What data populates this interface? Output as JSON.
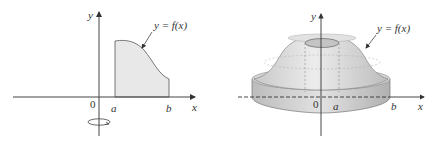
{
  "left_figure": {
    "y_axis_label": "y",
    "x_axis_label": "x",
    "origin_label": "0",
    "a_label": "a",
    "b_label": "b",
    "curve_label": "y = f(x)",
    "region_fill": "#e8e8e8",
    "rotation_indicator": "rotation-about-y-axis"
  },
  "right_figure": {
    "y_axis_label": "y",
    "x_axis_label": "x",
    "origin_label": "0",
    "a_label": "a",
    "b_label": "b",
    "curve_label": "y = f(x)",
    "solid_fill": "#dcdcdc"
  }
}
